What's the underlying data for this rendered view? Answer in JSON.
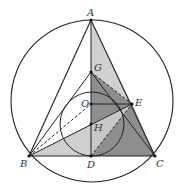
{
  "diagram": {
    "type": "geometry",
    "points": {
      "A": {
        "label": "A",
        "x": 91,
        "y": 20
      },
      "G": {
        "label": "G",
        "x": 91,
        "y": 72
      },
      "O": {
        "label": "O",
        "x": 91,
        "y": 104
      },
      "H": {
        "label": "H",
        "x": 91,
        "y": 124
      },
      "D": {
        "label": "D",
        "x": 91,
        "y": 156
      },
      "B": {
        "label": "B",
        "x": 29,
        "y": 156
      },
      "C": {
        "label": "C",
        "x": 155,
        "y": 156
      },
      "E": {
        "label": "E",
        "x": 132,
        "y": 104
      }
    },
    "circles": [
      {
        "name": "circumcircle",
        "cx": 92,
        "cy": 101,
        "r": 81
      },
      {
        "name": "inner-circle",
        "cx": 92,
        "cy": 124,
        "r": 32
      }
    ],
    "colors": {
      "stroke": "#222222",
      "shade_light": "#d4d4d4",
      "shade_mid": "#b0b0b0",
      "shade_dark": "#8a8a8a"
    }
  }
}
